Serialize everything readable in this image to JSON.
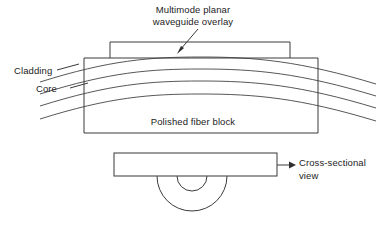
{
  "figure": {
    "kind": "technical-line-diagram",
    "background_color": "#ffffff",
    "line_color": "#3a3a3a"
  },
  "labels": {
    "overlay_title_line1": "Multimode planar",
    "overlay_title_line2": "waveguide overlay",
    "cladding": "Cladding",
    "core": "Core",
    "polished_fiber_block": "Polished fiber block",
    "cross_section_line1": "Cross-sectional",
    "cross_section_line2": "view"
  },
  "top_view": {
    "overlay_box": {
      "x": 110,
      "y": 42,
      "width": 180,
      "height": 16
    },
    "fiber_block": {
      "x": 84,
      "y": 58,
      "width": 234,
      "height": 75
    },
    "curve_count": 4,
    "curve_names": [
      "cladding-upper",
      "core-upper",
      "core-lower",
      "cladding-lower"
    ],
    "curve_center_y": [
      62,
      73,
      85,
      97
    ],
    "curve_span_x": [
      40,
      376
    ]
  },
  "cross_section": {
    "block": {
      "x": 114,
      "y": 153,
      "width": 163,
      "height": 23
    },
    "outer_semicircle_radius": 35,
    "inner_semicircle_radius": 15,
    "semicircle_center": {
      "x": 192,
      "y": 176
    },
    "arrow": {
      "from_x": 277,
      "to_x": 296,
      "y": 165
    }
  },
  "annotations": {
    "overlay_arrow": {
      "from_x": 196,
      "from_y": 31,
      "to_x": 178,
      "to_y": 53
    },
    "cladding_leader": {
      "from_x": 58,
      "from_y": 68,
      "to_x": 78,
      "to_y": 63
    },
    "core_leader": {
      "from_x": 72,
      "from_y": 86,
      "to_x": 86,
      "to_y": 82
    }
  }
}
